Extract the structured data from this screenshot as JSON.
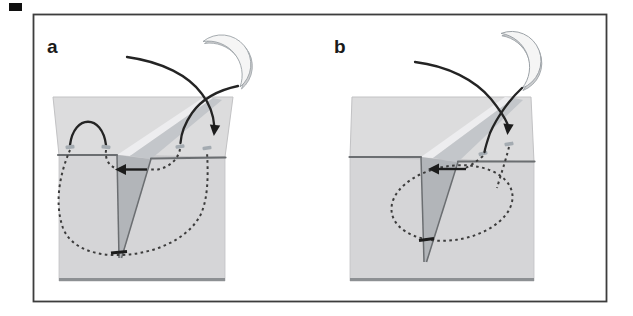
{
  "figure": {
    "type": "surgical-suture-technique-diagram",
    "panels": [
      {
        "label": "a"
      },
      {
        "label": "b"
      }
    ],
    "icons": {
      "needle": "suture-needle-icon",
      "deep_path": "dashed-suture-path",
      "pull_arrow": "left-direction-arrow",
      "thread_arrow": "down-direction-arrow"
    }
  },
  "colors": {
    "frame_border": "#3d3d3d",
    "artifact": "#101010",
    "tissue_top": "#dcdcdd",
    "tissue_front": "#d5d5d7",
    "wedge_shadow": "#b2b5b9",
    "channel_light": "#ededef",
    "channel_shadow": "#c3c6ca",
    "surface_line": "#6b6e71",
    "bottom_line": "#8d9093",
    "block_edge": "#c2c2c4",
    "thread": "#242424",
    "dashed_path": "#3c3c3c",
    "arrow": "#1c1c1c",
    "needle_body": "#cdced0",
    "needle_highlight": "#f5f5f5",
    "needle_outline": "#9ba1a6",
    "entry_tick": "#a4abb1",
    "label": "#1a1a1a"
  }
}
